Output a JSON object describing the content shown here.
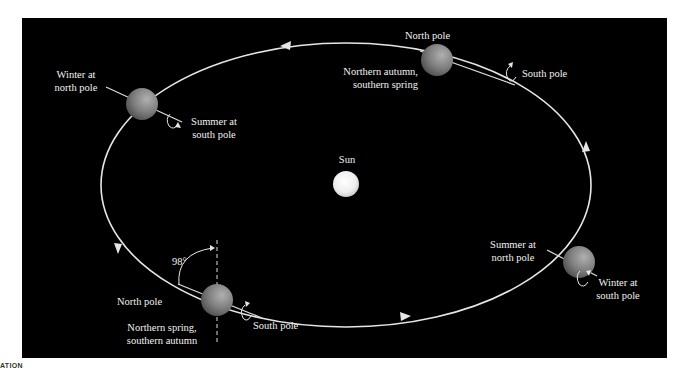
{
  "colors": {
    "background": "#000000",
    "page": "#ffffff",
    "orbit": "#e6e6e6",
    "text": "#f2f2f2",
    "sun": "#f4f4f4",
    "planet": "#8a8a8a"
  },
  "sun": {
    "label": "Sun"
  },
  "orbit": {
    "direction": "counterclockwise",
    "arrow_count": 4
  },
  "positions": [
    {
      "id": "top-left",
      "season_label": [
        "Winter at",
        "north pole"
      ],
      "pole_label": [
        "Summer at",
        "south pole"
      ]
    },
    {
      "id": "top-right",
      "north_label": "North pole",
      "season_label": [
        "Northern autumn,",
        "southern spring"
      ],
      "south_label": "South pole"
    },
    {
      "id": "bottom-left",
      "tilt_label": "98°",
      "north_label": "North pole",
      "season_label": [
        "Northern spring,",
        "southern autumn"
      ],
      "south_label": "South pole"
    },
    {
      "id": "right",
      "season_label": [
        "Summer at",
        "north pole"
      ],
      "pole_label": [
        "Winter at",
        "south pole"
      ]
    }
  ],
  "footer": {
    "text": "ATION"
  }
}
